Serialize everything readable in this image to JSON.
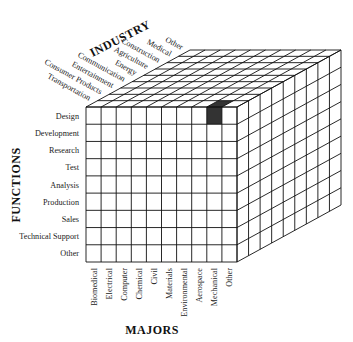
{
  "diagram": {
    "type": "3d-matrix-cube",
    "axes": {
      "industry": {
        "title": "INDUSTRY",
        "labels": [
          "Transportation",
          "Consumer Products",
          "Entertainment",
          "Communication",
          "Energy",
          "Agriculture",
          "Construction",
          "Medical",
          "Other"
        ]
      },
      "functions": {
        "title": "FUNCTIONS",
        "labels": [
          "Design",
          "Development",
          "Research",
          "Test",
          "Analysis",
          "Production",
          "Sales",
          "Technical Support",
          "Other"
        ]
      },
      "majors": {
        "title": "MAJORS",
        "labels": [
          "Biomedical",
          "Electrical",
          "Computer",
          "Chemical",
          "Civil",
          "Materials",
          "Environmental",
          "Aerospace",
          "Mechanical",
          "Other"
        ]
      }
    },
    "highlighted_cell": {
      "major": "Mechanical",
      "function": "Design",
      "industry": "Transportation",
      "color": "#333333"
    },
    "colors": {
      "line": "#111111",
      "background": "#ffffff",
      "highlight": "#333333"
    }
  }
}
